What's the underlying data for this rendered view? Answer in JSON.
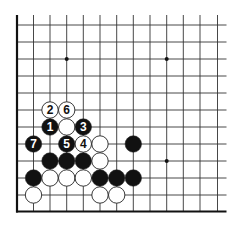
{
  "diagram": {
    "type": "go-board-corner",
    "colors": {
      "background": "#ffffff",
      "line": "#333333",
      "black_stone": "#111111",
      "white_stone": "#ffffff",
      "stone_outline": "#222222"
    },
    "grid": {
      "columns_x": [
        17,
        33.5,
        50,
        66.7,
        83.3,
        100,
        116.7,
        133.3,
        150,
        166.7,
        183.3,
        200,
        217.5
      ],
      "rows_y": [
        25,
        42,
        59,
        76,
        93,
        110,
        127,
        144,
        161,
        178,
        195,
        211.5
      ],
      "edges": [
        "left",
        "bottom"
      ]
    },
    "star_points": [
      {
        "col": 3,
        "row": 2
      },
      {
        "col": 9,
        "row": 2
      },
      {
        "col": 9,
        "row": 8
      }
    ],
    "stones": [
      {
        "col": 2,
        "row": 5,
        "color": "white",
        "label": "2"
      },
      {
        "col": 3,
        "row": 5,
        "color": "white",
        "label": "6"
      },
      {
        "col": 2,
        "row": 6,
        "color": "black",
        "label": "1"
      },
      {
        "col": 3,
        "row": 6,
        "color": "white",
        "label": ""
      },
      {
        "col": 4,
        "row": 6,
        "color": "black",
        "label": "3"
      },
      {
        "col": 1,
        "row": 7,
        "color": "black",
        "label": "7"
      },
      {
        "col": 3,
        "row": 7,
        "color": "black",
        "label": "5"
      },
      {
        "col": 4,
        "row": 7,
        "color": "white",
        "label": "4"
      },
      {
        "col": 5,
        "row": 7,
        "color": "white",
        "label": ""
      },
      {
        "col": 7,
        "row": 7,
        "color": "black",
        "label": ""
      },
      {
        "col": 2,
        "row": 8,
        "color": "black",
        "label": ""
      },
      {
        "col": 3,
        "row": 8,
        "color": "black",
        "label": ""
      },
      {
        "col": 4,
        "row": 8,
        "color": "black",
        "label": ""
      },
      {
        "col": 5,
        "row": 8,
        "color": "white",
        "label": ""
      },
      {
        "col": 1,
        "row": 9,
        "color": "black",
        "label": ""
      },
      {
        "col": 2,
        "row": 9,
        "color": "white",
        "label": ""
      },
      {
        "col": 3,
        "row": 9,
        "color": "white",
        "label": ""
      },
      {
        "col": 4,
        "row": 9,
        "color": "white",
        "label": ""
      },
      {
        "col": 5,
        "row": 9,
        "color": "black",
        "label": ""
      },
      {
        "col": 6,
        "row": 9,
        "color": "black",
        "label": ""
      },
      {
        "col": 7,
        "row": 9,
        "color": "black",
        "label": ""
      },
      {
        "col": 1,
        "row": 10,
        "color": "white",
        "label": ""
      },
      {
        "col": 5,
        "row": 10,
        "color": "white",
        "label": ""
      },
      {
        "col": 6,
        "row": 10,
        "color": "white",
        "label": ""
      }
    ]
  }
}
